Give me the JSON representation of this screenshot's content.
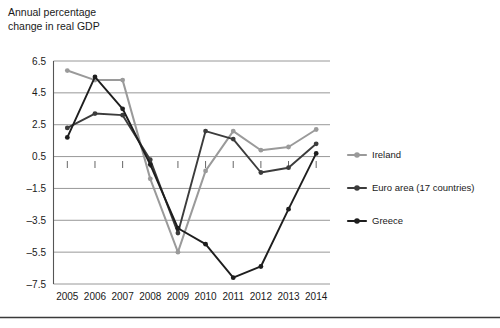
{
  "chart_data": {
    "type": "line",
    "title": "Annual percentage\nchange in real GDP",
    "xlabel": "",
    "ylabel": "Annual percentage change in real GDP",
    "categories": [
      "2005",
      "2006",
      "2007",
      "2008",
      "2009",
      "2010",
      "2011",
      "2012",
      "2013",
      "2014"
    ],
    "x": [
      2005,
      2006,
      2007,
      2008,
      2009,
      2010,
      2011,
      2012,
      2013,
      2014
    ],
    "yticks": [
      6.5,
      4.5,
      2.5,
      0.5,
      -1.5,
      -3.5,
      -5.5,
      -7.5
    ],
    "ylim": [
      -7.5,
      6.5
    ],
    "grid": true,
    "legend_position": "right",
    "series": [
      {
        "name": "Ireland",
        "color": "#9a9a9a",
        "values": [
          5.9,
          5.3,
          5.3,
          -0.9,
          -5.5,
          -0.4,
          2.1,
          0.9,
          1.1,
          2.2
        ]
      },
      {
        "name": "Euro area (17 countries)",
        "color": "#3c3c3c",
        "values": [
          2.3,
          3.2,
          3.1,
          0.3,
          -4.3,
          2.1,
          1.6,
          -0.5,
          -0.2,
          1.3
        ]
      },
      {
        "name": "Greece",
        "color": "#1e1e1e",
        "values": [
          1.7,
          5.5,
          3.5,
          0.0,
          -4.0,
          -5.0,
          -7.1,
          -6.4,
          -2.8,
          0.7
        ]
      }
    ]
  },
  "legend": {
    "items": [
      {
        "label": "Ireland",
        "color": "#9a9a9a"
      },
      {
        "label": "Euro area (17 countries)",
        "color": "#3c3c3c"
      },
      {
        "label": "Greece",
        "color": "#1e1e1e"
      }
    ]
  }
}
